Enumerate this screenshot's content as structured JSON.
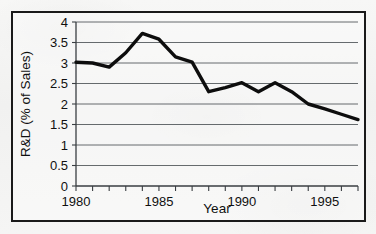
{
  "chart_data": {
    "type": "line",
    "title": "",
    "xlabel": "Year",
    "ylabel": "R&D (% of Sales)",
    "x": [
      1980,
      1981,
      1982,
      1983,
      1984,
      1985,
      1986,
      1987,
      1988,
      1989,
      1990,
      1991,
      1992,
      1993,
      1994,
      1995,
      1996,
      1997
    ],
    "values": [
      3.02,
      3.0,
      2.9,
      3.25,
      3.72,
      3.58,
      3.15,
      3.02,
      2.3,
      2.4,
      2.52,
      2.3,
      2.52,
      2.3,
      2.0,
      1.88,
      1.75,
      1.62
    ],
    "series": [
      {
        "name": "R&D (% of Sales)",
        "values": [
          3.02,
          3.0,
          2.9,
          3.25,
          3.72,
          3.58,
          3.15,
          3.02,
          2.3,
          2.4,
          2.52,
          2.3,
          2.52,
          2.3,
          2.0,
          1.88,
          1.75,
          1.62
        ]
      }
    ],
    "xlim": [
      1980,
      1997
    ],
    "ylim": [
      0,
      4
    ],
    "ytick_labels": [
      "0",
      "0.5",
      "1",
      "1.5",
      "2",
      "2.5",
      "3",
      "3.5",
      "4"
    ],
    "ytick_values": [
      0,
      0.5,
      1,
      1.5,
      2,
      2.5,
      3,
      3.5,
      4
    ],
    "xtick_labels": [
      "1980",
      "1985",
      "1990",
      "1995"
    ],
    "xtick_values": [
      1980,
      1985,
      1990,
      1995
    ],
    "xminor_values": [
      1980,
      1981,
      1982,
      1983,
      1984,
      1985,
      1986,
      1987,
      1988,
      1989,
      1990,
      1991,
      1992,
      1993,
      1994,
      1995,
      1996,
      1997
    ],
    "grid": "horizontal",
    "legend": "none",
    "line_color": "#0d0d0d",
    "grid_color": "#555a5e",
    "background_color": "#f4f4f3",
    "border_color": "#1a1a1a"
  }
}
